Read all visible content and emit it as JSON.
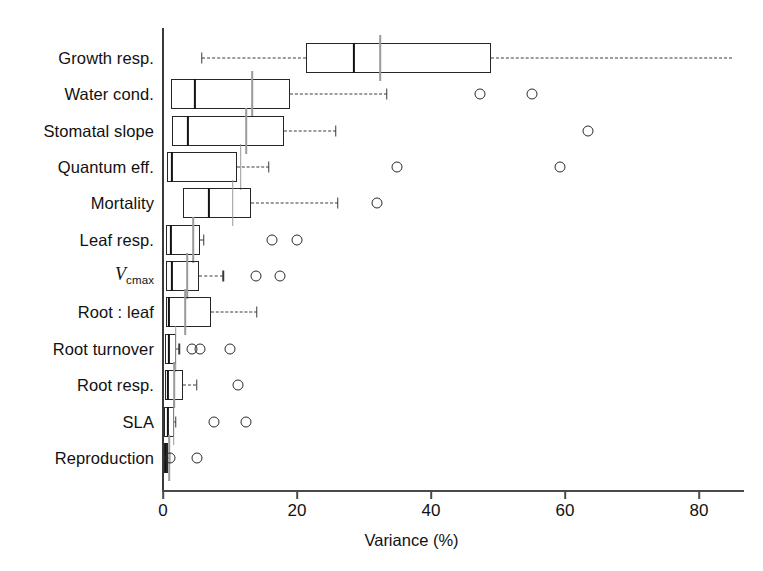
{
  "chart_data": {
    "type": "box",
    "title": "",
    "xlabel": "Variance (%)",
    "ylabel": "",
    "xlim": [
      0,
      87
    ],
    "xticks": [
      0,
      20,
      40,
      60,
      80
    ],
    "xticklabels": [
      "0",
      "20",
      "40",
      "60",
      "80"
    ],
    "grid": false,
    "legend": "none",
    "orientation": "horizontal",
    "categories": [
      "Growth resp.",
      "Water cond.",
      "Stomatal slope",
      "Quantum eff.",
      "Mortality",
      "Leaf resp.",
      "Vcmax",
      "Root : leaf",
      "Root turnover",
      "Root resp.",
      "SLA",
      "Reproduction"
    ],
    "boxes": [
      {
        "category": "Growth resp.",
        "label": "Growth resp.",
        "whisker_low": 5.8,
        "q1": 21.4,
        "median": 28.5,
        "mean": 32.4,
        "q3": 49.0,
        "whisker_high": 85.0,
        "outliers": []
      },
      {
        "category": "Water cond.",
        "label": "Water cond.",
        "whisker_low": 1.2,
        "q1": 1.2,
        "median": 4.8,
        "mean": 13.3,
        "q3": 19.0,
        "whisker_high": 33.4,
        "outliers": [
          47.3,
          55.0
        ]
      },
      {
        "category": "Stomatal slope",
        "label": "Stomatal slope",
        "whisker_low": 1.3,
        "q1": 1.3,
        "median": 3.7,
        "mean": 12.4,
        "q3": 18.0,
        "whisker_high": 25.8,
        "outliers": [
          63.4
        ]
      },
      {
        "category": "Quantum eff.",
        "label": "Quantum eff.",
        "whisker_low": 0.6,
        "q1": 0.6,
        "median": 1.3,
        "mean": 11.6,
        "q3": 11.0,
        "whisker_high": 15.8,
        "outliers": [
          34.9,
          59.3
        ]
      },
      {
        "category": "Mortality",
        "label": "Mortality",
        "whisker_low": 3.0,
        "q1": 3.0,
        "median": 6.9,
        "mean": 10.4,
        "q3": 13.1,
        "whisker_high": 26.1,
        "outliers": [
          32.0
        ]
      },
      {
        "category": "Leaf resp.",
        "label": "Leaf resp.",
        "whisker_low": 0.4,
        "q1": 0.4,
        "median": 1.2,
        "mean": 4.5,
        "q3": 5.5,
        "whisker_high": 6.1,
        "outliers": [
          16.3,
          20.0
        ]
      },
      {
        "category": "Vcmax",
        "label": "V",
        "label_sub": "cmax",
        "whisker_low": 0.4,
        "q1": 0.4,
        "median": 1.3,
        "mean": 3.6,
        "q3": 5.4,
        "whisker_high": 9.0,
        "outliers": [
          13.9,
          17.5
        ]
      },
      {
        "category": "Root : leaf",
        "label": "Root : leaf",
        "whisker_low": 0.4,
        "q1": 0.4,
        "median": 0.9,
        "mean": 3.3,
        "q3": 7.2,
        "whisker_high": 14.0,
        "outliers": []
      },
      {
        "category": "Root turnover",
        "label": "Root turnover",
        "whisker_low": 0.3,
        "q1": 0.3,
        "median": 0.9,
        "mean": 1.9,
        "q3": 2.0,
        "whisker_high": 2.4,
        "outliers": [
          4.3,
          5.5,
          10.0
        ]
      },
      {
        "category": "Root resp.",
        "label": "Root resp.",
        "whisker_low": 0.3,
        "q1": 0.3,
        "median": 0.7,
        "mean": 1.7,
        "q3": 3.0,
        "whisker_high": 5.0,
        "outliers": [
          11.2
        ]
      },
      {
        "category": "SLA",
        "label": "SLA",
        "whisker_low": 0.2,
        "q1": 0.2,
        "median": 0.7,
        "mean": 1.6,
        "q3": 1.6,
        "whisker_high": 1.9,
        "outliers": [
          7.6,
          12.4
        ]
      },
      {
        "category": "Reproduction",
        "label": "Reproduction",
        "whisker_low": 0.1,
        "q1": 0.1,
        "median": 0.4,
        "mean": 0.9,
        "q3": 0.8,
        "whisker_high": 1.0,
        "outliers": [
          1.0,
          5.0
        ]
      }
    ],
    "colors": {
      "box_stroke": "#262626",
      "median": "#121212",
      "mean": "#9a9a9a",
      "whisker": "#3a3a3a",
      "outlier": "#2b2b2b",
      "axis": "#4a4a4a",
      "background": "#ffffff"
    }
  },
  "axis": {
    "x_title": "Variance (%)"
  }
}
